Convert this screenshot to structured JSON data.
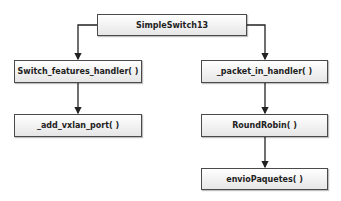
{
  "diagram": {
    "type": "call-hierarchy",
    "nodes": {
      "root": {
        "label": "SimpleSwitch13"
      },
      "switch_features": {
        "label": "Switch_features_handler( )"
      },
      "add_vxlan": {
        "label": "_add_vxlan_port( )"
      },
      "packet_in": {
        "label": "_packet_in_handler( )"
      },
      "round_robin": {
        "label": "RoundRobin( )"
      },
      "envio": {
        "label": "envioPaquetes( )"
      }
    },
    "edges": [
      {
        "from": "root",
        "to": "switch_features"
      },
      {
        "from": "root",
        "to": "packet_in"
      },
      {
        "from": "switch_features",
        "to": "add_vxlan"
      },
      {
        "from": "packet_in",
        "to": "round_robin"
      },
      {
        "from": "round_robin",
        "to": "envio"
      }
    ],
    "colors": {
      "border": "#4a4a4a",
      "edge": "#222222",
      "fill_top": "#ffffff",
      "fill_bottom": "#e6e6e6"
    }
  }
}
